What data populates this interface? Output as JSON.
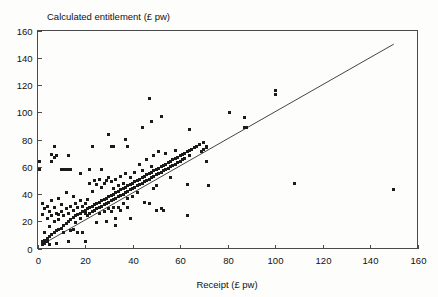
{
  "figure": {
    "title": "Calculated entitlement (£ pw)",
    "background_color": "#fdfdfc",
    "axis_color": "#4a4a4a",
    "point_color": "#1b1b1b",
    "line_color": "#303030"
  },
  "chart_data": {
    "type": "scatter",
    "title": "Calculated entitlement (£ pw)",
    "xlabel": "Receipt (£ pw)",
    "ylabel": "Calculated entitlement (£ pw)",
    "xlim": [
      0,
      160
    ],
    "ylim": [
      0,
      160
    ],
    "xticks": [
      0,
      20,
      40,
      60,
      80,
      100,
      120,
      140,
      160
    ],
    "yticks": [
      0,
      20,
      40,
      60,
      80,
      100,
      120,
      140,
      160
    ],
    "xtick_labels": [
      "0",
      "20",
      "40",
      "60",
      "80",
      "100",
      "120",
      "140",
      "160"
    ],
    "ytick_labels": [
      "0",
      "20",
      "40",
      "60",
      "80",
      "100",
      "120",
      "140",
      "160"
    ],
    "grid": false,
    "legend": null,
    "marker": "square",
    "marker_size_px": 3,
    "reference_line": {
      "name": "y = x identity line",
      "x": [
        2,
        150
      ],
      "y": [
        3,
        150
      ]
    },
    "series": [
      {
        "name": "Households",
        "points": [
          [
            1,
            58
          ],
          [
            1,
            64
          ],
          [
            2,
            3
          ],
          [
            2,
            5
          ],
          [
            2,
            33
          ],
          [
            2,
            25
          ],
          [
            3,
            4
          ],
          [
            3,
            6
          ],
          [
            3,
            29
          ],
          [
            3,
            12
          ],
          [
            4,
            7
          ],
          [
            4,
            22
          ],
          [
            4,
            31
          ],
          [
            4,
            5
          ],
          [
            5,
            9
          ],
          [
            5,
            16
          ],
          [
            5,
            27
          ],
          [
            5,
            3
          ],
          [
            6,
            10
          ],
          [
            6,
            35
          ],
          [
            6,
            24
          ],
          [
            6,
            64
          ],
          [
            6,
            69
          ],
          [
            7,
            12
          ],
          [
            7,
            20
          ],
          [
            7,
            75
          ],
          [
            7,
            67
          ],
          [
            7,
            30
          ],
          [
            8,
            13
          ],
          [
            8,
            26
          ],
          [
            8,
            4
          ],
          [
            8,
            68
          ],
          [
            9,
            14
          ],
          [
            9,
            25
          ],
          [
            9,
            37
          ],
          [
            9,
            21
          ],
          [
            10,
            15
          ],
          [
            10,
            27
          ],
          [
            10,
            58
          ],
          [
            10,
            32
          ],
          [
            11,
            17
          ],
          [
            11,
            24
          ],
          [
            11,
            12
          ],
          [
            11,
            58
          ],
          [
            12,
            18
          ],
          [
            12,
            29
          ],
          [
            12,
            58
          ],
          [
            12,
            41
          ],
          [
            13,
            20
          ],
          [
            13,
            26
          ],
          [
            13,
            58
          ],
          [
            13,
            5
          ],
          [
            13,
            68
          ],
          [
            14,
            21
          ],
          [
            14,
            31
          ],
          [
            14,
            58
          ],
          [
            14,
            13
          ],
          [
            15,
            23
          ],
          [
            15,
            28
          ],
          [
            15,
            14
          ],
          [
            15,
            38
          ],
          [
            16,
            24
          ],
          [
            16,
            33
          ],
          [
            16,
            19
          ],
          [
            17,
            25
          ],
          [
            17,
            30
          ],
          [
            17,
            12
          ],
          [
            18,
            26
          ],
          [
            18,
            35
          ],
          [
            18,
            22
          ],
          [
            18,
            55
          ],
          [
            19,
            27
          ],
          [
            19,
            31
          ],
          [
            19,
            12
          ],
          [
            20,
            28
          ],
          [
            20,
            5
          ],
          [
            20,
            33
          ],
          [
            20,
            26
          ],
          [
            21,
            29
          ],
          [
            21,
            36
          ],
          [
            21,
            24
          ],
          [
            22,
            30
          ],
          [
            22,
            26
          ],
          [
            22,
            48
          ],
          [
            22,
            58
          ],
          [
            23,
            31
          ],
          [
            23,
            27
          ],
          [
            23,
            42
          ],
          [
            23,
            75
          ],
          [
            24,
            32
          ],
          [
            24,
            28
          ],
          [
            24,
            50
          ],
          [
            25,
            33
          ],
          [
            25,
            29
          ],
          [
            25,
            47
          ],
          [
            25,
            19
          ],
          [
            26,
            34
          ],
          [
            26,
            30
          ],
          [
            26,
            26
          ],
          [
            26,
            51
          ],
          [
            27,
            35
          ],
          [
            27,
            31
          ],
          [
            27,
            45
          ],
          [
            27,
            58
          ],
          [
            28,
            36
          ],
          [
            28,
            32
          ],
          [
            28,
            27
          ],
          [
            28,
            48
          ],
          [
            29,
            37
          ],
          [
            29,
            33
          ],
          [
            29,
            50
          ],
          [
            29,
            20
          ],
          [
            30,
            38
          ],
          [
            30,
            34
          ],
          [
            30,
            29
          ],
          [
            30,
            52
          ],
          [
            30,
            84
          ],
          [
            31,
            39
          ],
          [
            31,
            35
          ],
          [
            31,
            49
          ],
          [
            31,
            27
          ],
          [
            31,
            75
          ],
          [
            32,
            40
          ],
          [
            32,
            36
          ],
          [
            32,
            44
          ],
          [
            32,
            30
          ],
          [
            32,
            75
          ],
          [
            33,
            41
          ],
          [
            33,
            37
          ],
          [
            33,
            51
          ],
          [
            33,
            22
          ],
          [
            33,
            17
          ],
          [
            34,
            42
          ],
          [
            34,
            38
          ],
          [
            34,
            46
          ],
          [
            34,
            30
          ],
          [
            35,
            43
          ],
          [
            35,
            39
          ],
          [
            35,
            53
          ],
          [
            35,
            28
          ],
          [
            36,
            44
          ],
          [
            36,
            40
          ],
          [
            36,
            48
          ],
          [
            36,
            33
          ],
          [
            37,
            45
          ],
          [
            37,
            41
          ],
          [
            37,
            55
          ],
          [
            37,
            80
          ],
          [
            38,
            46
          ],
          [
            38,
            42
          ],
          [
            38,
            37
          ],
          [
            38,
            75
          ],
          [
            38,
            30
          ],
          [
            39,
            47
          ],
          [
            39,
            43
          ],
          [
            39,
            22
          ],
          [
            39,
            52
          ],
          [
            40,
            48
          ],
          [
            40,
            44
          ],
          [
            40,
            38
          ],
          [
            41,
            49
          ],
          [
            41,
            45
          ],
          [
            41,
            56
          ],
          [
            42,
            50
          ],
          [
            42,
            46
          ],
          [
            42,
            41
          ],
          [
            43,
            51
          ],
          [
            43,
            47
          ],
          [
            43,
            62
          ],
          [
            44,
            52
          ],
          [
            44,
            48
          ],
          [
            44,
            57
          ],
          [
            44,
            89
          ],
          [
            45,
            53
          ],
          [
            45,
            49
          ],
          [
            45,
            34
          ],
          [
            46,
            54
          ],
          [
            46,
            50
          ],
          [
            46,
            65
          ],
          [
            47,
            55
          ],
          [
            47,
            51
          ],
          [
            47,
            33
          ],
          [
            47,
            110
          ],
          [
            48,
            56
          ],
          [
            48,
            52
          ],
          [
            48,
            60
          ],
          [
            48,
            93
          ],
          [
            49,
            57
          ],
          [
            49,
            53
          ],
          [
            49,
            68
          ],
          [
            49,
            44
          ],
          [
            50,
            58
          ],
          [
            50,
            54
          ],
          [
            50,
            46
          ],
          [
            50,
            28
          ],
          [
            51,
            59
          ],
          [
            51,
            55
          ],
          [
            51,
            71
          ],
          [
            52,
            60
          ],
          [
            52,
            56
          ],
          [
            52,
            29
          ],
          [
            52,
            97
          ],
          [
            53,
            61
          ],
          [
            53,
            57
          ],
          [
            53,
            28
          ],
          [
            54,
            62
          ],
          [
            54,
            58
          ],
          [
            54,
            70
          ],
          [
            55,
            63
          ],
          [
            55,
            59
          ],
          [
            56,
            64
          ],
          [
            56,
            60
          ],
          [
            56,
            52
          ],
          [
            57,
            65
          ],
          [
            57,
            61
          ],
          [
            58,
            66
          ],
          [
            58,
            62
          ],
          [
            58,
            72
          ],
          [
            59,
            67
          ],
          [
            59,
            63
          ],
          [
            60,
            68
          ],
          [
            60,
            64
          ],
          [
            61,
            69
          ],
          [
            61,
            65
          ],
          [
            62,
            70
          ],
          [
            62,
            66
          ],
          [
            63,
            71
          ],
          [
            63,
            47
          ],
          [
            63,
            24
          ],
          [
            64,
            72
          ],
          [
            64,
            87
          ],
          [
            64,
            68
          ],
          [
            65,
            73
          ],
          [
            66,
            74
          ],
          [
            67,
            75
          ],
          [
            68,
            76
          ],
          [
            69,
            71
          ],
          [
            70,
            73
          ],
          [
            70,
            78
          ],
          [
            71,
            74
          ],
          [
            71,
            64
          ],
          [
            71,
            75
          ],
          [
            72,
            46
          ],
          [
            81,
            100
          ],
          [
            87,
            96
          ],
          [
            87,
            89
          ],
          [
            88,
            89
          ],
          [
            100,
            113
          ],
          [
            100,
            116
          ],
          [
            108,
            48
          ],
          [
            150,
            43
          ]
        ]
      }
    ]
  },
  "axis_titles": {
    "x": "Receipt (£ pw)",
    "y_top_label": "Calculated entitlement (£ pw)"
  }
}
